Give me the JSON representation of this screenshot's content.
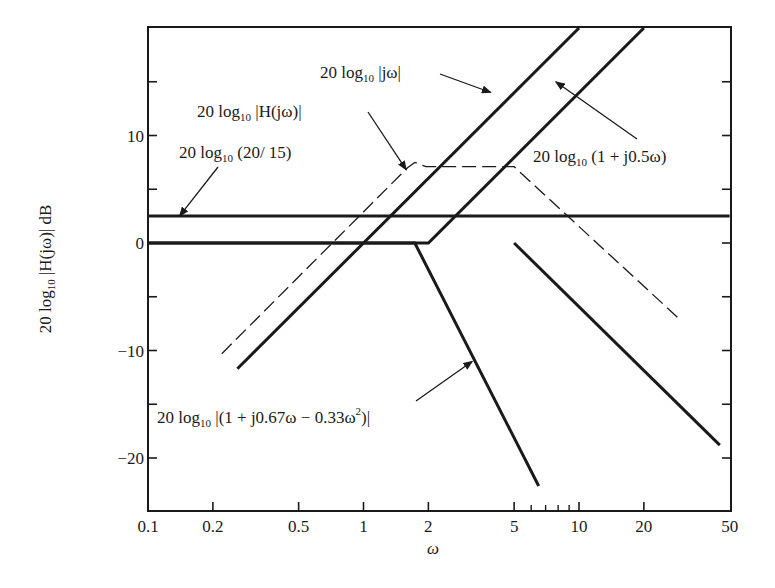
{
  "chart_data": {
    "type": "line",
    "title": "",
    "xlabel": "ω",
    "ylabel": "20 log10 |H(jω)|  dB",
    "xscale": "log",
    "xlim": [
      0.1,
      50
    ],
    "ylim": [
      -25,
      20
    ],
    "grid": false,
    "legend": "none (inline annotations with arrows)",
    "x_ticks": [
      0.1,
      0.2,
      0.5,
      1,
      2,
      5,
      10,
      20,
      50
    ],
    "x_tick_labels": [
      "0.1",
      "0.2",
      "0.5",
      "1",
      "2",
      "5",
      "10",
      "20",
      "50"
    ],
    "x_minor_ticks": [
      6,
      7,
      8,
      9
    ],
    "y_ticks": [
      -20,
      -15,
      -10,
      -5,
      0,
      5,
      10,
      15
    ],
    "y_tick_labels": [
      "−20",
      "",
      "−10",
      "",
      "0",
      "",
      "10",
      ""
    ],
    "series": [
      {
        "name": "20 log10 (20/15)",
        "style": "solid-thick",
        "points": [
          [
            0.1,
            2.5
          ],
          [
            50,
            2.5
          ]
        ]
      },
      {
        "name": "20 log10 |jω|",
        "style": "solid-thick",
        "points": [
          [
            0.26,
            -11.7
          ],
          [
            10,
            20
          ]
        ]
      },
      {
        "name": "20 log10 (1 + j0.5ω)",
        "style": "solid-thick",
        "points": [
          [
            0.1,
            0
          ],
          [
            2,
            0
          ],
          [
            20,
            20
          ]
        ]
      },
      {
        "name": "20 log10 |(1 + j0.67ω − 0.33ω²)|",
        "style": "solid-thick",
        "points": [
          [
            0.1,
            0
          ],
          [
            1.73,
            0
          ],
          [
            6.5,
            -22.6
          ]
        ]
      },
      {
        "name": "0 dB break at ω=5 (descending asymptote)",
        "style": "solid-thick",
        "points": [
          [
            5,
            0
          ],
          [
            45,
            -18.8
          ]
        ]
      },
      {
        "name": "20 log10 |H(jω)|",
        "style": "dashed-thin",
        "points": [
          [
            0.22,
            -10.3
          ],
          [
            1.6,
            7.0
          ],
          [
            1.73,
            7.5
          ],
          [
            1.95,
            7.1
          ],
          [
            5,
            7.1
          ],
          [
            29,
            -7.0
          ]
        ]
      }
    ],
    "annotations": [
      {
        "text": "20 log10 |jω|",
        "arrow_to": [
          3.9,
          14
        ]
      },
      {
        "text": "20 log10 |H(jω)|",
        "arrow_to": [
          1.58,
          6.8
        ]
      },
      {
        "text": "20 log10 (20/15)",
        "arrow_to": [
          0.14,
          2.5
        ]
      },
      {
        "text": "20 log10 (1 + j0.5ω)",
        "arrow_to": [
          7.8,
          15
        ]
      },
      {
        "text": "20 log10 |(1 + j0.67ω − 0.33ω²)|",
        "arrow_to": [
          3.2,
          -11
        ]
      }
    ]
  },
  "labels": {
    "xlabel": "ω",
    "ylabel_prefix": "20 log",
    "ylabel_sub": "10",
    "ylabel_suffix": " |H(jω)|  dB",
    "ann_jw": {
      "pre": "20 log",
      "sub": "10",
      "post": " |jω|"
    },
    "ann_H": {
      "pre": "20 log",
      "sub": "10",
      "post": " |H(jω)|"
    },
    "ann_k": {
      "pre": "20 log",
      "sub": "10",
      "post": " (20/ 15)"
    },
    "ann_pole": {
      "pre": "20 log",
      "sub": "10",
      "post": " (1 + j0.5ω)"
    },
    "ann_quad": {
      "pre": "20 log",
      "sub": "10",
      "post": "  |(1 + j0.67ω − 0.33ω",
      "sup": "2",
      "end": ")|"
    }
  }
}
